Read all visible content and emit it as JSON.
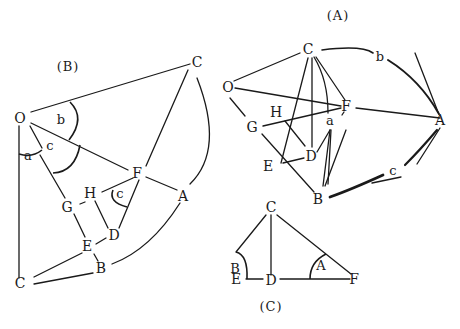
{
  "figures": {
    "B": {
      "caption": "(B)",
      "points": {
        "O": "O",
        "C_top": "C",
        "C_bottom": "C",
        "F": "F",
        "A": "A",
        "H": "H",
        "G": "G",
        "D": "D",
        "E": "E",
        "B": "B"
      },
      "angles": {
        "a": "a",
        "b": "b",
        "c_at_O": "c",
        "c_at_F": "c"
      }
    },
    "A": {
      "caption": "(A)",
      "points": {
        "C": "C",
        "O": "O",
        "F": "F",
        "A": "A",
        "H": "H",
        "G": "G",
        "D": "D",
        "E": "E",
        "B": "B"
      },
      "arcs": {
        "a": "a",
        "b": "b",
        "c": "c"
      }
    },
    "C": {
      "caption": "(C)",
      "points": {
        "C": "C",
        "E": "E",
        "D": "D",
        "F": "F"
      },
      "angles": {
        "B": "B",
        "A": "A"
      }
    }
  }
}
